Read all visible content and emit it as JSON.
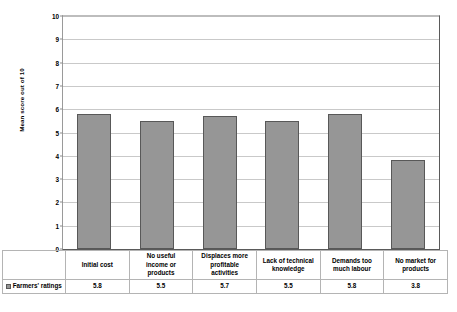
{
  "chart_data": {
    "type": "bar",
    "title": "",
    "xlabel": "",
    "ylabel": "Mean score out of 10",
    "ylim": [
      0,
      10
    ],
    "ytick_labels": [
      "10",
      "9",
      "8",
      "7",
      "6",
      "5",
      "4",
      "3",
      "2",
      "1",
      "0"
    ],
    "yticks": [
      10,
      9,
      8,
      7,
      6,
      5,
      4,
      3,
      2,
      1,
      0
    ],
    "grid": true,
    "legend_position": "bottom-left-table",
    "categories": [
      "Initial cost",
      "No useful income or products",
      "Displaces more profitable activities",
      "Lack of technical knowledge",
      "Demands too much labour",
      "No market for products"
    ],
    "category_lines": [
      [
        "Initial cost"
      ],
      [
        "No useful",
        "income or",
        "products"
      ],
      [
        "Displaces more",
        "profitable",
        "activities"
      ],
      [
        "Lack of technical",
        "knowledge"
      ],
      [
        "Demands too",
        "much labour"
      ],
      [
        "No market for",
        "products"
      ]
    ],
    "series": [
      {
        "name": "Farmers' ratings",
        "values": [
          5.8,
          5.5,
          5.7,
          5.5,
          5.8,
          3.8
        ],
        "value_labels": [
          "5.8",
          "5.5",
          "5.7",
          "5.5",
          "5.8",
          "3.8"
        ],
        "color": "#969696",
        "border_color": "#585858"
      }
    ]
  },
  "table": {
    "legend_label": "Farmers' ratings",
    "legend_icon": "legend-swatch-icon"
  },
  "colors": {
    "bar_fill": "#969696",
    "bar_border": "#585858",
    "gridline": "#c9c9c9",
    "axis": "#5a5a5a",
    "table_border": "#b4b4b4",
    "background": "#ffffff",
    "text": "#000000"
  }
}
